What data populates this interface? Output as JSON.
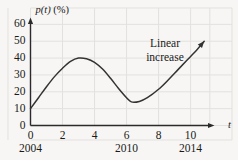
{
  "chart_data": {
    "type": "line",
    "title": "",
    "ylabel": "p(t) (%)",
    "ylabel_var": "p(t)",
    "ylabel_unit": "(%)",
    "xlabel": "t",
    "xlim": [
      0,
      11.4
    ],
    "ylim": [
      0,
      62
    ],
    "grid": true,
    "legend": null,
    "yticks": [
      0,
      10,
      20,
      30,
      40,
      50,
      60
    ],
    "ytick_labels": [
      "0",
      "10",
      "20",
      "30",
      "40",
      "50",
      "60"
    ],
    "xticks": [
      0,
      2,
      4,
      6,
      8,
      10
    ],
    "xtick_labels": [
      "0",
      "2",
      "4",
      "6",
      "8",
      "10"
    ],
    "secondary_xticks": [
      0,
      6,
      10
    ],
    "secondary_xtick_labels": [
      "2004",
      "2010",
      "2014"
    ],
    "annotations": [
      {
        "text": "Linear increase",
        "line1": "Linear",
        "line2": "increase",
        "x": 8.4,
        "y": 47
      }
    ],
    "series": [
      {
        "name": "p(t)",
        "color": "#333333",
        "arrow_end": true,
        "points": [
          {
            "x": 0.0,
            "y": 10.0
          },
          {
            "x": 0.5,
            "y": 16.5
          },
          {
            "x": 1.0,
            "y": 23.0
          },
          {
            "x": 1.5,
            "y": 29.0
          },
          {
            "x": 2.0,
            "y": 34.0
          },
          {
            "x": 2.5,
            "y": 38.0
          },
          {
            "x": 3.0,
            "y": 40.0
          },
          {
            "x": 3.5,
            "y": 39.6
          },
          {
            "x": 4.0,
            "y": 37.5
          },
          {
            "x": 4.5,
            "y": 33.5
          },
          {
            "x": 5.0,
            "y": 28.0
          },
          {
            "x": 5.5,
            "y": 22.0
          },
          {
            "x": 6.0,
            "y": 16.5
          },
          {
            "x": 6.3,
            "y": 14.0
          },
          {
            "x": 6.8,
            "y": 14.3
          },
          {
            "x": 7.3,
            "y": 16.5
          },
          {
            "x": 8.0,
            "y": 21.5
          },
          {
            "x": 8.6,
            "y": 27.0
          },
          {
            "x": 9.2,
            "y": 33.0
          },
          {
            "x": 9.8,
            "y": 39.0
          },
          {
            "x": 10.4,
            "y": 45.0
          },
          {
            "x": 10.85,
            "y": 50.0
          }
        ]
      }
    ]
  },
  "axis_titles": {
    "y_var": "p(t)",
    "y_unit": "(%)",
    "x": "t"
  },
  "colors": {
    "background": "#f7f6f4",
    "grid": "#e3e1de",
    "axis": "#2b2b2b",
    "curve": "#333333",
    "text": "#1a1a1a"
  }
}
